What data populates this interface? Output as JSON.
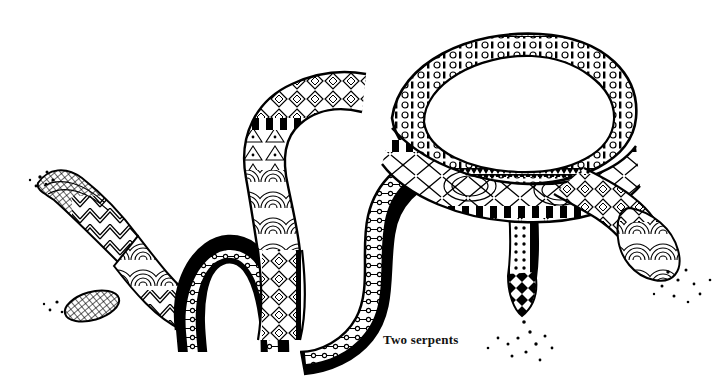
{
  "artwork": {
    "title": "Two serpents",
    "caption": "Two serpents",
    "medium": "pen-and-ink line drawing",
    "style": "zentangle patterned ink illustration",
    "background_color": "#ffffff",
    "ink_color": "#000000",
    "canvas": {
      "width": 718,
      "height": 380
    },
    "caption_position": {
      "x": 383,
      "y": 332
    },
    "subjects": [
      {
        "name": "left-serpent",
        "head_position": {
          "x": 60,
          "y": 180
        },
        "tail_position": {
          "x": 520,
          "y": 300
        },
        "description": "tapering pointed head upper-left, body loops down into a low arch then sweeps right in a long S-curve"
      },
      {
        "name": "right-serpent",
        "head_position": {
          "x": 660,
          "y": 230
        },
        "tail_position": {
          "x": 95,
          "y": 305
        },
        "description": "large oval loop at upper right, descending arm ending in a patterned head at lower right"
      }
    ],
    "motifs": [
      "crosshatch-scales",
      "nested-chevrons",
      "concentric-arcs",
      "diamond-chain",
      "circle-and-bar-chain",
      "sawtooth-edge",
      "checker-band",
      "dot-stipple",
      "x-cross-lattice",
      "zigzag-wave"
    ],
    "stipple_clusters": [
      {
        "name": "upper-left-stipple",
        "x": 45,
        "y": 175
      },
      {
        "name": "lower-left-stipple",
        "x": 55,
        "y": 305
      },
      {
        "name": "below-tail-stipple",
        "x": 525,
        "y": 330
      },
      {
        "name": "lower-right-stipple",
        "x": 675,
        "y": 280
      }
    ]
  }
}
